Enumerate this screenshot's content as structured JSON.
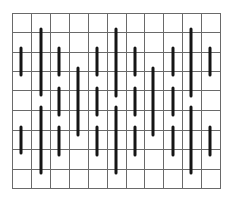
{
  "figure": {
    "type": "grid-with-vertical-bars",
    "width": 234,
    "height": 203,
    "colors": {
      "background": "#ffffff",
      "grid": "#6a6a6a",
      "bar": "#151515"
    },
    "grid": {
      "x_lines": [
        12,
        31,
        50,
        69,
        88,
        107,
        126,
        144,
        163,
        182,
        201,
        220
      ],
      "y_lines": [
        13,
        32,
        52,
        71,
        90,
        110,
        130,
        149,
        169,
        188
      ],
      "columns": 11,
      "rows": 9
    },
    "bar_width": 3,
    "bars": [
      {
        "x": 21,
        "y1": 48,
        "y2": 75
      },
      {
        "x": 21,
        "y1": 127,
        "y2": 153
      },
      {
        "x": 41,
        "y1": 29,
        "y2": 95
      },
      {
        "x": 41,
        "y1": 107,
        "y2": 173
      },
      {
        "x": 59,
        "y1": 48,
        "y2": 75
      },
      {
        "x": 59,
        "y1": 88,
        "y2": 115
      },
      {
        "x": 59,
        "y1": 127,
        "y2": 155
      },
      {
        "x": 78,
        "y1": 68,
        "y2": 135
      },
      {
        "x": 97,
        "y1": 48,
        "y2": 75
      },
      {
        "x": 97,
        "y1": 88,
        "y2": 115
      },
      {
        "x": 97,
        "y1": 127,
        "y2": 155
      },
      {
        "x": 116,
        "y1": 29,
        "y2": 96
      },
      {
        "x": 116,
        "y1": 107,
        "y2": 173
      },
      {
        "x": 135,
        "y1": 48,
        "y2": 75
      },
      {
        "x": 135,
        "y1": 88,
        "y2": 115
      },
      {
        "x": 135,
        "y1": 127,
        "y2": 155
      },
      {
        "x": 153,
        "y1": 68,
        "y2": 135
      },
      {
        "x": 173,
        "y1": 48,
        "y2": 75
      },
      {
        "x": 173,
        "y1": 88,
        "y2": 115
      },
      {
        "x": 173,
        "y1": 127,
        "y2": 155
      },
      {
        "x": 191,
        "y1": 29,
        "y2": 96
      },
      {
        "x": 191,
        "y1": 107,
        "y2": 173
      },
      {
        "x": 210,
        "y1": 48,
        "y2": 75
      },
      {
        "x": 210,
        "y1": 127,
        "y2": 155
      }
    ]
  }
}
